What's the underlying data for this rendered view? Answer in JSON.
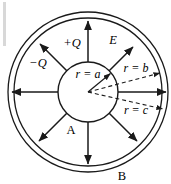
{
  "figure": {
    "background_color": "#ffffff",
    "stroke_color": "#1a1a1a",
    "edge_artifact_color": "#d8d8d8",
    "center": {
      "x": 88,
      "y": 92
    },
    "geometry": {
      "inner_sphere_radius": 30,
      "shell_inner_radius": 74,
      "shell_outer_radius": 80
    },
    "labels": {
      "inner_charge": "+Q",
      "shell_charge": "−Q",
      "field": "E",
      "radius_a": "r = a",
      "radius_b": "r = b",
      "radius_c": "r = c",
      "region_a": "A",
      "region_b": "B"
    },
    "label_positions": {
      "inner_charge": {
        "x": 72,
        "y": 47
      },
      "shell_charge": {
        "x": 38,
        "y": 67
      },
      "field": {
        "x": 113,
        "y": 44
      },
      "radius_a": {
        "x": 88,
        "y": 77
      },
      "radius_b": {
        "x": 136,
        "y": 72
      },
      "radius_c": {
        "x": 136,
        "y": 113
      },
      "region_a": {
        "x": 71,
        "y": 133
      },
      "region_b": {
        "x": 122,
        "y": 179
      }
    },
    "field_arrows": [
      {
        "name": "field-arrow-up",
        "angle_deg": 270,
        "dashed": false
      },
      {
        "name": "field-arrow-down",
        "angle_deg": 90,
        "dashed": false
      },
      {
        "name": "field-arrow-left",
        "angle_deg": 180,
        "dashed": false
      },
      {
        "name": "field-arrow-right",
        "angle_deg": 0,
        "dashed": false
      },
      {
        "name": "field-arrow-up-left",
        "angle_deg": 225,
        "dashed": false
      },
      {
        "name": "field-arrow-up-right",
        "angle_deg": 315,
        "dashed": false
      },
      {
        "name": "field-arrow-down-left",
        "angle_deg": 135,
        "dashed": false
      },
      {
        "name": "field-arrow-down-right",
        "angle_deg": 45,
        "dashed": false
      }
    ],
    "radius_leaders": [
      {
        "name": "leader-a",
        "target": "inner sphere surface",
        "dashed": false
      },
      {
        "name": "leader-b",
        "target": "shell inner surface",
        "dashed": true
      },
      {
        "name": "leader-c",
        "target": "shell outer surface",
        "dashed": true
      }
    ]
  }
}
